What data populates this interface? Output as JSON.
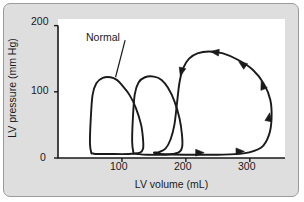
{
  "figure": {
    "background_color": "#dedede",
    "plot_background_color": "#ffffff",
    "border_color": "#9a9a9a",
    "line_color": "#1a1a1a"
  },
  "annotations": {
    "normal_label": "Normal"
  },
  "chart_data": {
    "type": "line",
    "title": "",
    "xlabel": "LV volume (mL)",
    "ylabel": "LV pressure (mm Hg)",
    "xlim": [
      0,
      355
    ],
    "ylim": [
      0,
      210
    ],
    "xticks": [
      100,
      200,
      300
    ],
    "xticklabels": [
      "100",
      "200",
      "300"
    ],
    "yticks": [
      0,
      100,
      200
    ],
    "yticklabels": [
      "0",
      "100",
      "200"
    ],
    "grid": false,
    "legend": null,
    "annotations": [
      {
        "text": "Normal",
        "x": 105,
        "y": 178,
        "pointer_to": {
          "x": 90,
          "y": 122
        }
      }
    ],
    "series": [
      {
        "name": "Normal pressure-volume loop",
        "closed": true,
        "arrows": [],
        "points": [
          [
            52,
            8
          ],
          [
            50,
            22
          ],
          [
            51,
            55
          ],
          [
            54,
            95
          ],
          [
            60,
            113
          ],
          [
            70,
            121
          ],
          [
            82,
            122
          ],
          [
            92,
            118
          ],
          [
            100,
            110
          ],
          [
            112,
            95
          ],
          [
            122,
            75
          ],
          [
            130,
            50
          ],
          [
            133,
            28
          ],
          [
            133,
            14
          ],
          [
            128,
            8
          ],
          [
            110,
            6
          ],
          [
            80,
            6
          ],
          [
            62,
            6
          ],
          [
            54,
            7
          ],
          [
            52,
            8
          ]
        ]
      },
      {
        "name": "Intermediate pressure-volume loop",
        "closed": true,
        "arrows": [],
        "points": [
          [
            118,
            8
          ],
          [
            116,
            24
          ],
          [
            117,
            58
          ],
          [
            120,
            96
          ],
          [
            126,
            114
          ],
          [
            136,
            122
          ],
          [
            150,
            123
          ],
          [
            162,
            118
          ],
          [
            172,
            106
          ],
          [
            182,
            86
          ],
          [
            190,
            60
          ],
          [
            194,
            34
          ],
          [
            194,
            16
          ],
          [
            188,
            8
          ],
          [
            168,
            5
          ],
          [
            140,
            5
          ],
          [
            125,
            6
          ],
          [
            119,
            7
          ],
          [
            118,
            8
          ]
        ]
      },
      {
        "name": "Enlarged (failing) pressure-volume loop",
        "closed": true,
        "direction": "counterclockwise",
        "arrows": [
          {
            "x": 222,
            "y": 8,
            "angle": 0
          },
          {
            "x": 285,
            "y": 10,
            "angle": 0
          },
          {
            "x": 330,
            "y": 62,
            "angle": 80
          },
          {
            "x": 320,
            "y": 110,
            "angle": 110
          },
          {
            "x": 288,
            "y": 142,
            "angle": 145
          },
          {
            "x": 245,
            "y": 160,
            "angle": 172
          },
          {
            "x": 193,
            "y": 130,
            "angle": 255
          }
        ],
        "points": [
          [
            150,
            8
          ],
          [
            160,
            6
          ],
          [
            200,
            5
          ],
          [
            250,
            5
          ],
          [
            290,
            7
          ],
          [
            318,
            16
          ],
          [
            330,
            35
          ],
          [
            334,
            60
          ],
          [
            332,
            88
          ],
          [
            322,
            112
          ],
          [
            305,
            133
          ],
          [
            282,
            148
          ],
          [
            258,
            158
          ],
          [
            236,
            161
          ],
          [
            218,
            158
          ],
          [
            205,
            150
          ],
          [
            196,
            136
          ],
          [
            190,
            114
          ],
          [
            186,
            82
          ],
          [
            182,
            50
          ],
          [
            176,
            28
          ],
          [
            168,
            14
          ],
          [
            158,
            9
          ],
          [
            150,
            8
          ]
        ]
      }
    ]
  }
}
